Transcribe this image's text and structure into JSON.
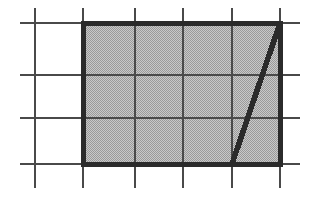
{
  "figure": {
    "type": "geometry-diagram",
    "canvas": {
      "width": 318,
      "height": 206,
      "background": "#ffffff"
    },
    "colors": {
      "grid_line": "#4a4a4a",
      "shape_outline": "#2b2b2b",
      "shape_fill": "#b4b4b4",
      "diagonal": "#2b2b2b",
      "background": "#ffffff"
    },
    "grid": {
      "label": "square grid",
      "line_width": 2.6,
      "vertical_lines_x": [
        35,
        83,
        135,
        183,
        232,
        280
      ],
      "horizontal_lines_y": [
        23,
        75,
        118,
        164
      ],
      "vertical_extent_y": [
        8,
        188
      ],
      "horizontal_extent_x": [
        20,
        300
      ],
      "columns": 5,
      "rows": 3
    },
    "shape": {
      "label": "shaded rectangle",
      "outline_width": 5,
      "x": 83,
      "y": 23,
      "width": 197,
      "height": 141,
      "fill_pattern": "halftone-dither",
      "corners": [
        [
          83,
          23
        ],
        [
          280,
          23
        ],
        [
          280,
          164
        ],
        [
          83,
          164
        ]
      ]
    },
    "diagonal": {
      "label": "diagonal segment",
      "line_width": 5.5,
      "x1": 232,
      "y1": 164,
      "x2": 280,
      "y2": 23,
      "from": "bottom-edge-at-4th-interior-gridline",
      "to": "top-right-corner"
    }
  }
}
